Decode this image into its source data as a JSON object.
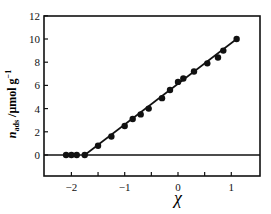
{
  "chart_data": {
    "type": "scatter",
    "title": "",
    "xlabel": "χ",
    "ylabel": "n_ads /μmol g⁻¹",
    "xlim": [
      -2.6,
      1.5
    ],
    "ylim": [
      -2.2,
      12
    ],
    "xticks": [
      -2,
      -1,
      0,
      1
    ],
    "yticks": [
      0,
      2,
      4,
      6,
      8,
      10,
      12
    ],
    "grid": false,
    "legend": null,
    "series": [
      {
        "name": "data",
        "marker": "filled-circle",
        "x": [
          -2.1,
          -2.0,
          -1.9,
          -1.75,
          -1.5,
          -1.25,
          -1.0,
          -0.85,
          -0.7,
          -0.55,
          -0.3,
          -0.15,
          0.0,
          0.1,
          0.3,
          0.55,
          0.75,
          0.85,
          1.1
        ],
        "y": [
          0,
          0,
          0,
          0,
          0.8,
          1.6,
          2.5,
          3.1,
          3.5,
          4.0,
          4.9,
          5.6,
          6.3,
          6.6,
          7.2,
          7.9,
          8.4,
          9.0,
          10.0
        ]
      }
    ],
    "lines": [
      {
        "name": "fit",
        "x": [
          -1.75,
          1.1
        ],
        "y": [
          0,
          10.0
        ]
      },
      {
        "name": "zero-line",
        "x": [
          -2.6,
          1.5
        ],
        "y": [
          0,
          0
        ]
      }
    ]
  },
  "labels": {
    "x_axis": "χ",
    "y_axis_main": "n",
    "y_axis_sub": "ads",
    "y_axis_unit": " /μmol g",
    "y_axis_exp": "−1"
  }
}
